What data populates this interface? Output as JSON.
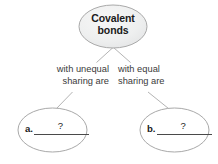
{
  "diagram": {
    "type": "concept-map",
    "root": {
      "line1": "Covalent",
      "line2": "bonds",
      "fill": "#eceded",
      "stroke": "#a8a8a8"
    },
    "branches": [
      {
        "label_line1": "with unequal",
        "label_line2": "sharing are",
        "answer_letter": "a.",
        "answer_value": "?",
        "node_fill": "#ffffff",
        "node_stroke": "#a8a8a8"
      },
      {
        "label_line1": "with equal",
        "label_line2": "sharing are",
        "answer_letter": "b.",
        "answer_value": "?",
        "node_fill": "#ffffff",
        "node_stroke": "#a8a8a8"
      }
    ],
    "connector_color": "#b0b0b0"
  }
}
